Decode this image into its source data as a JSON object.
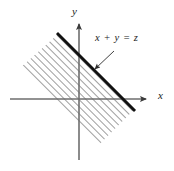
{
  "figure": {
    "background_color": "#ffffff",
    "axis_color": "#6e6e6e",
    "boundary_color": "#111111",
    "hatch_color": "#555555",
    "label_color": "#1a1a1a"
  },
  "axes": {
    "x_label": "x",
    "y_label": "y",
    "x_axis": {
      "x1": 10,
      "y1": 99,
      "x2": 150,
      "y2": 99,
      "arrow": "right"
    },
    "y_axis": {
      "x1": 79,
      "y1": 160,
      "x2": 79,
      "y2": 18,
      "arrow": "up"
    }
  },
  "boundary": {
    "label": "x + y = z",
    "slope": -1,
    "start": {
      "x": 58,
      "y": 34
    },
    "end": {
      "x": 134,
      "y": 110
    }
  },
  "annotation": {
    "arrow_from": {
      "x": 114,
      "y": 51
    },
    "arrow_to": {
      "x": 93,
      "y": 71
    }
  },
  "region": {
    "description": "hatched band below and left of the line x + y = z",
    "hatch_angle_deg": 45,
    "hatch_spacing_px": 5,
    "polygon": "58,34 134,110 100,144 22,66"
  }
}
